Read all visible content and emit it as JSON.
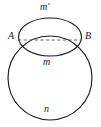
{
  "figure": {
    "kind": "geometry-diagram",
    "background_color": "#ffffff",
    "stroke_color": "#1c1c1c",
    "dash_color": "#4a4a4a",
    "large_circle": {
      "name": "large-circle",
      "center_x": 50,
      "center_y": 78,
      "radius": 42
    },
    "small_ellipse": {
      "name": "small-ellipse",
      "center_x": 50,
      "center_y": 37,
      "radius_x": 31.5,
      "radius_y": 19
    },
    "chord": {
      "name": "chord-ab",
      "x1": 18,
      "y1": 40,
      "x2": 81,
      "y2": 40,
      "style": "dashed"
    },
    "points": [
      {
        "id": "A",
        "label": "A",
        "x": 18,
        "y": 40
      },
      {
        "id": "B",
        "label": "B",
        "x": 81,
        "y": 40
      }
    ],
    "labels": {
      "arc_upper": "m'",
      "point_left": "A",
      "point_right": "B",
      "arc_lower": "m",
      "arc_bottom": "n"
    }
  }
}
